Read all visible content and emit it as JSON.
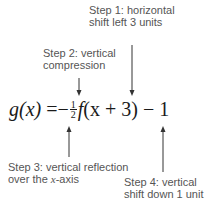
{
  "diagram": {
    "equation": {
      "lhs": "g(x)",
      "equals": "=",
      "sign": "−",
      "fraction": {
        "numerator": "1",
        "denominator": "2"
      },
      "function": "f",
      "argument": "(x + 3)",
      "operator": "−",
      "constant": "1"
    },
    "annotations": [
      {
        "id": "step1",
        "line1": "Step 1: horizontal",
        "line2": "shift left 3 units",
        "arrow": "down"
      },
      {
        "id": "step2",
        "line1": "Step 2: vertical",
        "line2": "compression",
        "arrow": "down"
      },
      {
        "id": "step3",
        "line1": "Step 3: vertical reflection",
        "line2_prefix": "over the ",
        "line2_var": "x",
        "line2_suffix": "-axis",
        "arrow": "up"
      },
      {
        "id": "step4",
        "line1": "Step 4: vertical",
        "line2": "shift down 1 unit",
        "arrow": "up"
      }
    ],
    "colors": {
      "text": "#555555",
      "equation": "#1a1a1a",
      "arrow": "#333333",
      "background": "#ffffff"
    }
  }
}
